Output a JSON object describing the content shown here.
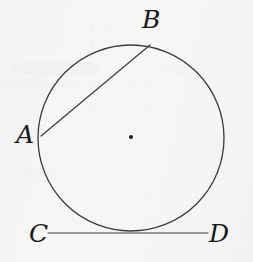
{
  "figure": {
    "kind": "geometry-diagram",
    "canvas": {
      "width": 253,
      "height": 262
    },
    "background_color": "#f6f6f5",
    "ink_color": "#3a3a40",
    "label_color": "#17171a"
  },
  "labels": {
    "a": "A",
    "b": "B",
    "c": "C",
    "d": "D"
  },
  "label_positions": {
    "a": {
      "x": 16,
      "y": 122,
      "size": 25
    },
    "b": {
      "x": 142,
      "y": 7,
      "size": 25
    },
    "c": {
      "x": 29,
      "y": 221,
      "size": 25
    },
    "d": {
      "x": 209,
      "y": 221,
      "size": 25
    }
  },
  "geometry": {
    "circle": {
      "name": "circle",
      "center_x": 131,
      "center_y": 138,
      "radius": 93,
      "stroke_width": 1.3
    },
    "center_point": {
      "name": "center-dot",
      "x": 131,
      "y": 137,
      "radius": 2.0
    },
    "chord_ab": {
      "name": "chord-AB",
      "x1": 41,
      "y1": 136,
      "x2": 150,
      "y2": 45,
      "stroke_width": 1.2
    },
    "tangent_cd": {
      "name": "tangent-line-CD",
      "x1": 48,
      "y1": 233,
      "x2": 208,
      "y2": 233,
      "stroke_width": 1.2
    }
  },
  "smudges": [
    {
      "x": 6,
      "y": 60,
      "w": 96,
      "h": 16,
      "opacity": 0.5
    },
    {
      "x": 2,
      "y": 78,
      "w": 74,
      "h": 12,
      "opacity": 0.4
    },
    {
      "x": 14,
      "y": 168,
      "w": 40,
      "h": 10,
      "opacity": 0.35
    },
    {
      "x": 160,
      "y": 62,
      "w": 46,
      "h": 12,
      "opacity": 0.3
    }
  ]
}
